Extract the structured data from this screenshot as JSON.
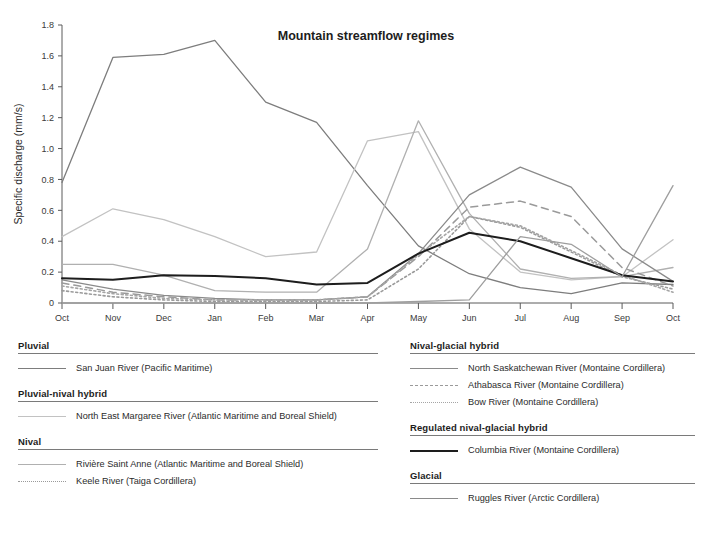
{
  "chart_data": {
    "type": "line",
    "title": "Mountain streamflow regimes",
    "xlabel": "",
    "ylabel": "Specific discharge (mm/s)",
    "categories": [
      "Oct",
      "Nov",
      "Dec",
      "Jan",
      "Feb",
      "Mar",
      "Apr",
      "May",
      "Jun",
      "Jul",
      "Aug",
      "Sep",
      "Oct"
    ],
    "ylim": [
      0,
      1.8
    ],
    "xlim_labels": [
      "Oct",
      "Oct"
    ],
    "yticks": [
      "0",
      "0.2",
      "0.4",
      "0.6",
      "0.8",
      "1.0",
      "1.2",
      "1.4",
      "1.6",
      "1.8"
    ],
    "ytick_values": [
      0,
      0.2,
      0.4,
      0.6,
      0.8,
      1.0,
      1.2,
      1.4,
      1.6,
      1.8
    ],
    "grid": false,
    "legend_position": "below",
    "series": [
      {
        "name": "San Juan River (Pacific Maritime)",
        "group": "Pluvial",
        "color": "#7d7d7d",
        "style": "solid",
        "width": 1.3,
        "values": [
          0.78,
          1.59,
          1.61,
          1.7,
          1.3,
          1.17,
          0.76,
          0.37,
          0.19,
          0.1,
          0.06,
          0.13,
          0.12
        ]
      },
      {
        "name": "North East Margaree River (Atlantic Maritime and Boreal Shield)",
        "group": "Pluvial-nival hybrid",
        "color": "#c2c2c2",
        "style": "solid",
        "width": 1.3,
        "values": [
          0.43,
          0.61,
          0.54,
          0.43,
          0.3,
          0.33,
          1.05,
          1.11,
          0.48,
          0.2,
          0.15,
          0.17,
          0.41
        ]
      },
      {
        "name": "Rivière Saint Anne (Atlantic Maritime and Boreal Shield)",
        "group": "Nival",
        "color": "#b0b0b0",
        "style": "solid",
        "width": 1.3,
        "values": [
          0.25,
          0.25,
          0.18,
          0.08,
          0.07,
          0.07,
          0.35,
          1.18,
          0.58,
          0.22,
          0.16,
          0.17,
          0.23
        ]
      },
      {
        "name": "Keele River (Taiga Cordillera)",
        "group": "Nival",
        "color": "#9a9a9a",
        "style": "dotted",
        "width": 1.6,
        "values": [
          0.08,
          0.04,
          0.02,
          0.01,
          0.01,
          0.01,
          0.02,
          0.22,
          0.56,
          0.49,
          0.33,
          0.17,
          0.09
        ]
      },
      {
        "name": "North Saskatchewan River (Montaine Cordillera)",
        "group": "Nival-glacial hybrid",
        "color": "#8a8a8a",
        "style": "solid",
        "width": 1.3,
        "values": [
          0.15,
          0.09,
          0.05,
          0.03,
          0.02,
          0.02,
          0.04,
          0.32,
          0.7,
          0.88,
          0.75,
          0.35,
          0.14
        ]
      },
      {
        "name": "Athabasca River (Montaine Cordillera)",
        "group": "Nival-glacial hybrid",
        "color": "#9a9a9a",
        "style": "dashed",
        "width": 1.5,
        "values": [
          0.13,
          0.07,
          0.04,
          0.02,
          0.02,
          0.02,
          0.04,
          0.3,
          0.62,
          0.66,
          0.56,
          0.23,
          0.11
        ]
      },
      {
        "name": "Bow River (Montaine Cordillera)",
        "group": "Nival-glacial hybrid",
        "color": "#a5a5a5",
        "style": "dotted",
        "width": 1.6,
        "values": [
          0.11,
          0.06,
          0.03,
          0.02,
          0.02,
          0.02,
          0.04,
          0.31,
          0.56,
          0.5,
          0.34,
          0.18,
          0.07
        ]
      },
      {
        "name": "Columbia River (Montaine Cordillera)",
        "group": "Regulated nival-glacial hybrid",
        "color": "#1d1d1d",
        "style": "solid",
        "width": 2.0,
        "values": [
          0.16,
          0.15,
          0.18,
          0.175,
          0.16,
          0.12,
          0.13,
          0.32,
          0.455,
          0.4,
          0.29,
          0.18,
          0.14
        ]
      },
      {
        "name": "Ruggles River (Arctic Cordillera)",
        "group": "Glacial",
        "color": "#9e9e9e",
        "style": "solid",
        "width": 1.3,
        "values": [
          0.0,
          0.0,
          0.0,
          0.0,
          0.0,
          0.0,
          0.0,
          0.01,
          0.02,
          0.43,
          0.38,
          0.17,
          0.76
        ]
      }
    ]
  },
  "legend": {
    "columns": [
      {
        "id": "left",
        "groups": [
          {
            "title": "Pluvial",
            "items": [
              {
                "label": "San Juan River (Pacific Maritime)",
                "color": "#7d7d7d",
                "style": "solid"
              }
            ]
          },
          {
            "title": "Pluvial-nival hybrid",
            "items": [
              {
                "label": "North East Margaree River (Atlantic Maritime and Boreal Shield)",
                "color": "#c2c2c2",
                "style": "solid"
              }
            ]
          },
          {
            "title": "Nival",
            "items": [
              {
                "label": "Rivière Saint Anne (Atlantic Maritime and Boreal Shield)",
                "color": "#b0b0b0",
                "style": "solid"
              },
              {
                "label": "Keele River (Taiga Cordillera)",
                "color": "#9a9a9a",
                "style": "dotted"
              }
            ]
          }
        ]
      },
      {
        "id": "right",
        "groups": [
          {
            "title": "Nival-glacial hybrid",
            "items": [
              {
                "label": "North Saskatchewan River (Montaine Cordillera)",
                "color": "#8a8a8a",
                "style": "solid"
              },
              {
                "label": "Athabasca River (Montaine Cordillera)",
                "color": "#9a9a9a",
                "style": "dashed"
              },
              {
                "label": "Bow River (Montaine Cordillera)",
                "color": "#a5a5a5",
                "style": "dotted"
              }
            ]
          },
          {
            "title": "Regulated nival-glacial hybrid",
            "items": [
              {
                "label": "Columbia River (Montaine Cordillera)",
                "color": "#1d1d1d",
                "style": "thick"
              }
            ]
          },
          {
            "title": "Glacial",
            "items": [
              {
                "label": "Ruggles River (Arctic Cordillera)",
                "color": "#8a8a8a",
                "style": "solid"
              }
            ]
          }
        ]
      }
    ]
  }
}
